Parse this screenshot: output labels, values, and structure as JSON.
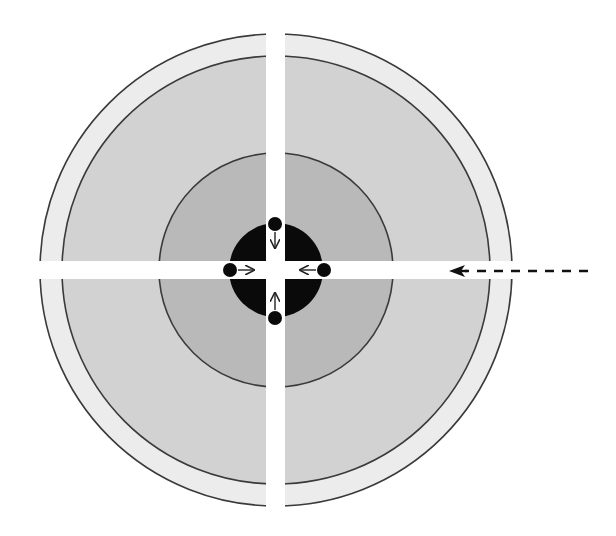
{
  "diagram": {
    "title": "",
    "width": 616,
    "height": 536,
    "background": "#ffffff",
    "center": {
      "x": 276,
      "y": 270
    },
    "rings": [
      {
        "name": "outer-shell",
        "r": 236,
        "fill": "#ececec",
        "stroke": "#3a3a3a"
      },
      {
        "name": "second-zone",
        "r": 214,
        "fill": "#d2d2d2",
        "stroke": "#3a3a3a"
      },
      {
        "name": "middle-zone",
        "r": 117,
        "fill": "#b9b9b9",
        "stroke": "#3a3a3a"
      },
      {
        "name": "core",
        "r": 47,
        "fill": "#0a0a0a",
        "stroke": "none"
      }
    ],
    "channels": {
      "color": "#ffffff",
      "horizontal": {
        "y": 261,
        "height": 18,
        "x_start": 30,
        "x_end": 520
      },
      "vertical": {
        "x": 266,
        "width": 19,
        "y_start": 20,
        "y_end": 520
      }
    },
    "particles": [
      {
        "name": "particle-left",
        "cx": 230,
        "cy": 270,
        "r": 7,
        "arrow": {
          "x1": 238,
          "y1": 270,
          "x2": 254,
          "y2": 270,
          "direction": "right"
        }
      },
      {
        "name": "particle-right",
        "cx": 324,
        "cy": 270,
        "r": 7,
        "arrow": {
          "x1": 316,
          "y1": 270,
          "x2": 300,
          "y2": 270,
          "direction": "left"
        }
      },
      {
        "name": "particle-top",
        "cx": 275,
        "cy": 224,
        "r": 7,
        "arrow": {
          "x1": 275,
          "y1": 232,
          "x2": 275,
          "y2": 248,
          "direction": "down"
        }
      },
      {
        "name": "particle-bottom",
        "cx": 275,
        "cy": 318,
        "r": 7,
        "arrow": {
          "x1": 275,
          "y1": 310,
          "x2": 275,
          "y2": 293,
          "direction": "up"
        }
      }
    ],
    "incoming_arrow": {
      "name": "incoming-beam",
      "x_start": 588,
      "x_end": 449,
      "y": 271,
      "dash": "9 8",
      "color": "#111111",
      "head": "solid"
    }
  }
}
